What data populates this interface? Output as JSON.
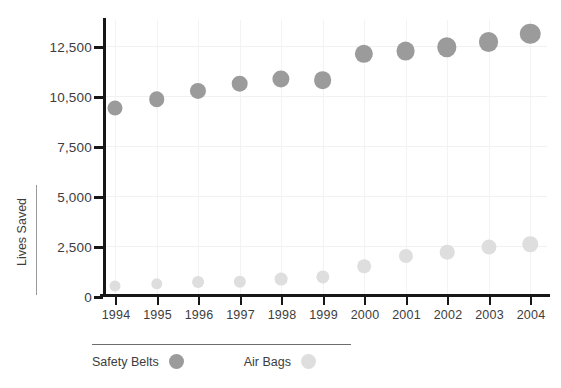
{
  "chart_data": {
    "type": "scatter",
    "title": "",
    "subtitle": "",
    "xlabel": "",
    "ylabel": "Lives Saved",
    "categories": [
      "1994",
      "1995",
      "1996",
      "1997",
      "1998",
      "1999",
      "2000",
      "2001",
      "2002",
      "2003",
      "2004"
    ],
    "x": [
      1994,
      1995,
      1996,
      1997,
      1998,
      1999,
      2000,
      2001,
      2002,
      2003,
      2004
    ],
    "series": [
      {
        "name": "Safety Belts",
        "color": "#9b9b9b",
        "marker": "circle",
        "values": [
          9800,
          10300,
          10700,
          11000,
          11200,
          11150,
          12200,
          12300,
          12450,
          12650,
          13000
        ]
      },
      {
        "name": "Air Bags",
        "color": "#dedede",
        "marker": "circle",
        "values": [
          500,
          600,
          700,
          700,
          850,
          950,
          1500,
          2000,
          2200,
          2450,
          2600
        ]
      }
    ],
    "ytick_values": [
      0,
      2500,
      5000,
      7500,
      10500,
      12500
    ],
    "ytick_labels": [
      "0",
      "2,500",
      "5,000",
      "7,500",
      "10,500",
      "12,500"
    ],
    "ylim": [
      0,
      13500
    ],
    "grid": true,
    "grid_axis": "both",
    "legend": {
      "position": "bottom-left",
      "entries": [
        {
          "label": "Safety Belts",
          "color": "#9b9b9b"
        },
        {
          "label": "Air Bags",
          "color": "#dedede"
        }
      ]
    },
    "colors": {
      "safety_belts": "#9b9b9b",
      "air_bags": "#dedede",
      "axis": "#171717",
      "grid": "#f2f0f2",
      "text": "#3d3d3d",
      "background": "#ffffff"
    }
  }
}
